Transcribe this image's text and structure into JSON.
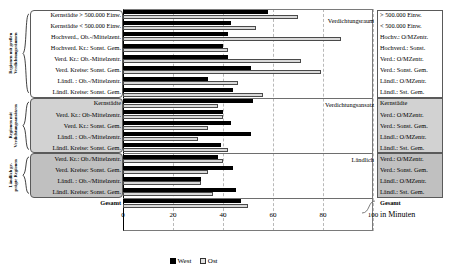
{
  "chart_data": {
    "type": "bar",
    "orientation": "horizontal",
    "title": "",
    "xlabel": "in Minuten",
    "ylabel": "",
    "xlim": [
      0,
      100
    ],
    "xticks": [
      0,
      20,
      40,
      60,
      80,
      100
    ],
    "grid": true,
    "legend_position": "bottom",
    "series": [
      {
        "name": "West",
        "color": "#000000"
      },
      {
        "name": "Ost",
        "color": "#d9d9d9"
      }
    ],
    "groups": [
      {
        "brace_label": "Regionen mit großen\nVerdichtungsräumen",
        "annotation": "Verdichtungsraum",
        "categories": [
          "Kernstädte > 500.000 Einw.",
          "Kernstädte < 500.000 Einw.",
          "Hochverd., Ob.-/Mittelzent.",
          "Hochverd. Kr.: Sonst. Gem.",
          "Verd. Kr.: Ob.-Mittelzentr.",
          "Verd. Kreise: Sonst. Gem.",
          "Ländl. : Ob.-/Mittelzentr.",
          "Ländl. Kreise: Sonst. Gem."
        ],
        "categories_right": [
          "> 500.000 Einw.",
          "< 500.000 Einw.",
          "Hochv.: O/MZentr.",
          "Hochverd.: Sonst.",
          "Verd.: O/MZentr.",
          "Verd.: Sonst. Gem.",
          "Ländl.: O/MZentr.",
          "Ländl.: Sst. Gem."
        ],
        "west": [
          58,
          43,
          42,
          40,
          42,
          51,
          34,
          44
        ],
        "ost": [
          70,
          53,
          87,
          42,
          71,
          79,
          46,
          56
        ]
      },
      {
        "brace_label": "Regionen mit\nVerdichtungsansätzen",
        "annotation": "Verdichtungsansatz",
        "categories": [
          "Kernstädte",
          "Verd. Kr.: Ob-Mittelzentr.",
          "Verd. Kr.: Sonst. Gem.",
          "Ländl. : Ob.-/Mittelzentr.",
          "Ländl. Kreise: Sonst. Gem."
        ],
        "categories_right": [
          "Kernstädte",
          "Verd.: O/MZentr.",
          "Verd.: Sonst. Gem.",
          "Ländl.: O/MZentr.",
          "Ländl.: Sst. Gem."
        ],
        "west": [
          52,
          40,
          43,
          51,
          39
        ],
        "ost": [
          38,
          40,
          34,
          30,
          42
        ]
      },
      {
        "brace_label": "Ländlich ge-\nprägte Regionen",
        "annotation": "Ländlich",
        "categories": [
          "Verd. Kr.: Ob./Mittelzentr.",
          "Verd. Kreise: Sonst. Gem.",
          "Ländl. : Ob.-/Mittelzentr.",
          "Ländl. Kreise: Sonst. Gem."
        ],
        "categories_right": [
          "Verd.: O/MZentr.",
          "Verd.: Sonst. Gem.",
          "Ländl.: O/MZentr.",
          "Ländl.: Sst. Gem."
        ],
        "west": [
          38,
          44,
          31,
          45
        ],
        "ost": [
          40,
          34,
          31,
          36
        ]
      },
      {
        "brace_label": "",
        "annotation": "",
        "categories": [
          "Gesamt"
        ],
        "categories_right": [
          "Gesamt"
        ],
        "west": [
          47
        ],
        "ost": [
          50
        ]
      }
    ]
  },
  "axis": {
    "ticks": [
      "0",
      "20",
      "40",
      "60",
      "80",
      "100"
    ],
    "unit_label": "in Minuten"
  },
  "legend": {
    "west": "West",
    "ost": "Ost"
  }
}
